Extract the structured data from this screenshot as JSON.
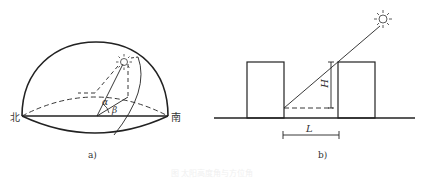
{
  "figure_a": {
    "north_label": "北",
    "south_label": "南",
    "alpha_label": "α",
    "beta_label": "β",
    "sublabel": "a)"
  },
  "figure_b": {
    "height_label": "H",
    "length_label": "L",
    "sublabel": "b)"
  },
  "caption": "图 太阳高度角与方位角"
}
